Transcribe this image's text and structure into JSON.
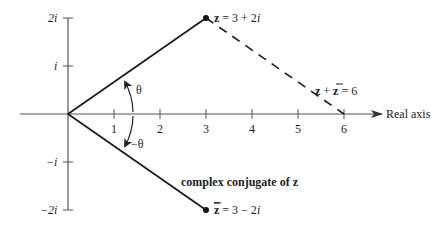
{
  "diagram": {
    "type": "complex-plane",
    "axes": {
      "real_axis_label": "Real axis",
      "x_ticks": [
        "1",
        "2",
        "3",
        "4",
        "5",
        "6"
      ],
      "y_ticks": [
        {
          "label": "2i",
          "value": 2
        },
        {
          "label": "i",
          "value": 1
        },
        {
          "label": "−i",
          "value": -1
        },
        {
          "label": "−2i",
          "value": -2
        }
      ]
    },
    "points": {
      "z": {
        "label_bold": "z",
        "label_rest": " = 3 + 2",
        "label_i": "i",
        "re": 3,
        "im": 2
      },
      "z_conj": {
        "label_bold": "z",
        "label_rest": " = 3 − 2",
        "label_i": "i",
        "re": 3,
        "im": -2
      }
    },
    "annotations": {
      "sum_label_left": "z",
      "sum_label_plus": " + ",
      "sum_label_right": "z",
      "sum_label_eq": " = 6",
      "conjugate_caption": "complex conjugate of z",
      "angle_upper": "θ",
      "angle_lower": "−θ"
    },
    "colors": {
      "line": "#1a1a1a",
      "axis": "#555555",
      "text": "#222222"
    }
  }
}
